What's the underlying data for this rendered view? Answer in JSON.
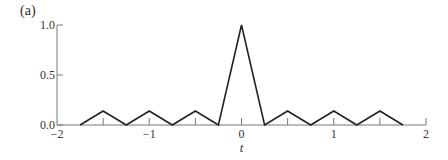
{
  "figure": {
    "panel_label": "(a)"
  },
  "chart_data": {
    "type": "line",
    "title": "",
    "panel_label": "(a)",
    "xlabel": "t",
    "ylabel": "",
    "xlim": [
      -2,
      2
    ],
    "ylim": [
      0,
      1.0
    ],
    "grid": false,
    "legend": null,
    "x_ticks": [
      -2,
      -1,
      0,
      1,
      2
    ],
    "x_tick_labels": [
      "−2",
      "−1",
      "0",
      "1",
      "2"
    ],
    "x_minor_ticks": [
      -1.5,
      -0.5,
      0.5,
      1.5
    ],
    "y_ticks": [
      0.0,
      0.5,
      1.0
    ],
    "y_tick_labels": [
      "0.0",
      "0.5",
      "1.0"
    ],
    "series": [
      {
        "name": "signal",
        "color": "#222222",
        "x": [
          -1.75,
          -1.5,
          -1.25,
          -1.0,
          -0.75,
          -0.5,
          -0.25,
          0.0,
          0.25,
          0.5,
          0.75,
          1.0,
          1.25,
          1.5,
          1.75
        ],
        "y": [
          0.0,
          0.14,
          0.0,
          0.14,
          0.0,
          0.14,
          0.0,
          1.0,
          0.0,
          0.14,
          0.0,
          0.14,
          0.0,
          0.14,
          0.0
        ]
      }
    ]
  }
}
